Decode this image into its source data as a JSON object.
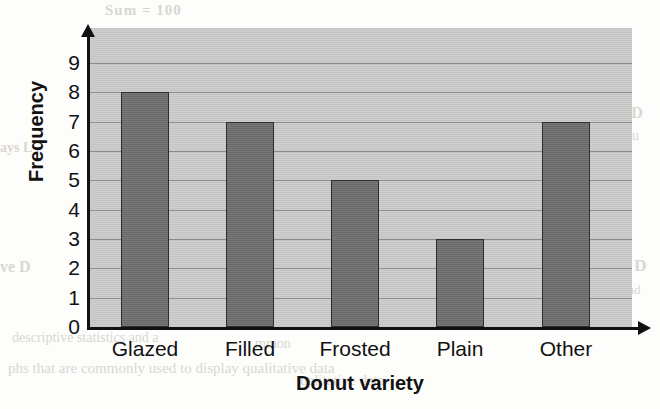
{
  "chart_data": {
    "type": "bar",
    "title": "",
    "categories": [
      "Glazed",
      "Filled",
      "Frosted",
      "Plain",
      "Other"
    ],
    "values": [
      8,
      7,
      5,
      3,
      7
    ],
    "xlabel": "Donut variety",
    "ylabel": "Frequency",
    "ylim": [
      0,
      9
    ],
    "ytick_labels": [
      "0",
      "1",
      "2",
      "3",
      "4",
      "5",
      "6",
      "7",
      "8",
      "9"
    ],
    "yticks": [
      0,
      1,
      2,
      3,
      4,
      5,
      6,
      7,
      8,
      9
    ],
    "grid": true,
    "legend": false,
    "legend_position": "none",
    "series": [
      {
        "name": "Frequency",
        "values": [
          8,
          7,
          5,
          3,
          7
        ]
      }
    ],
    "colors": {
      "bar_fill": "#6f6f6f",
      "bar_outline": "#2d2d2d",
      "plot_background": "#c9c9c9",
      "gridline": "#8d8d8d",
      "axis": "#111111",
      "page_background": "#fdfdfc"
    }
  },
  "axes": {
    "y_title": "Frequency",
    "x_title": "Donut variety",
    "y_labels": [
      "9",
      "8",
      "7",
      "6",
      "5",
      "4",
      "3",
      "2",
      "1",
      "0"
    ],
    "x_labels": [
      "Glazed",
      "Filled",
      "Frosted",
      "Plain",
      "Other"
    ]
  },
  "background_text": {
    "line1": "Sum = 100",
    "line2": "ns D",
    "line3": "requ",
    "line4": "ve D",
    "line5": "d and",
    "line6": "descriptive statistics and a",
    "line7": "phs that are commonly used to display qualitative data",
    "line8": "mmon",
    "line9": "ualitative data",
    "line10": "ays L",
    "line11": "ve D"
  }
}
